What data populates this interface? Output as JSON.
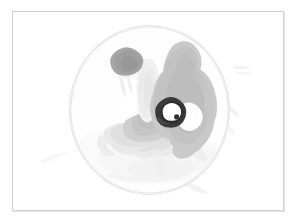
{
  "viewer": {
    "panel_name": "image-panel",
    "background_color": "#ffffff",
    "frame_color": "#cfcfcf"
  },
  "field_of_view": {
    "shape": "circle",
    "outline_color": "#e2e2e2",
    "center_x": 148,
    "center_y": 108,
    "radius_x": 80,
    "radius_y": 85
  },
  "palette": {
    "background": "#ffffff",
    "faint_tissue": "#f2f2f2",
    "light_tissue": "#e7e7e7",
    "mid_tissue": "#d3d3d3",
    "gray_mass": "#c9c9c9",
    "gray_mass_dark": "#bdbdbd",
    "nodule": "#a8a8a8",
    "dark_inclusion": "#3a3a3a",
    "inclusion_core": "#ffffff",
    "outline": "#e2e2e2"
  },
  "regions": [
    {
      "id": "upper-left-nodule",
      "label": "Upper left dark nodule",
      "fill": "#a8a8a8",
      "centroid": [
        122,
        57
      ],
      "approx_area_px": 210
    },
    {
      "id": "central-elongated-structure",
      "label": "Central faint elongated structure",
      "fill": "#f0f0f0",
      "centroid": [
        148,
        82
      ],
      "approx_area_px": 430
    },
    {
      "id": "right-gray-mass",
      "label": "Large right-side gray mass",
      "fill": "#c9c9c9",
      "centroid": [
        192,
        97
      ],
      "approx_area_px": 3100
    },
    {
      "id": "dark-annular-inclusion",
      "label": "Dark annular inclusion with bright core",
      "fill": "#3a3a3a",
      "core_fill": "#ffffff",
      "centroid": [
        176,
        103
      ],
      "approx_area_px": 150
    },
    {
      "id": "bright-lacuna",
      "label": "Bright lacuna within gray mass",
      "fill": "#ffffff",
      "centroid": [
        196,
        113
      ],
      "approx_area_px": 260
    },
    {
      "id": "lower-left-branching",
      "label": "Lower left pale branching structures",
      "fill": "#e3e3e3",
      "centroid": [
        118,
        135
      ],
      "approx_area_px": 1600
    },
    {
      "id": "basal-faint-tissue",
      "label": "Basal faint tissue sheets",
      "fill": "#f4f4f4",
      "centroid": [
        150,
        165
      ],
      "approx_area_px": 2400
    },
    {
      "id": "peripheral-marks",
      "label": "Faint marks outside field of view",
      "fill": "#f6f6f6",
      "centroid": [
        238,
        80
      ],
      "approx_area_px": 180
    }
  ]
}
